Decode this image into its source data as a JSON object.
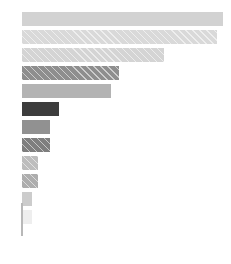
{
  "chart_data": {
    "type": "bar",
    "orientation": "horizontal",
    "title": "",
    "subtitle": "",
    "xlabel": "",
    "ylabel": "",
    "grid": false,
    "legend": null,
    "legend_position": "none",
    "categories": [
      "1",
      "2",
      "3",
      "4",
      "5",
      "6",
      "7",
      "8",
      "9",
      "10",
      "11",
      "12"
    ],
    "tick_labels": [],
    "xlim": [
      0,
      100
    ],
    "ylim": [
      0,
      12
    ],
    "values": [
      100,
      97,
      71,
      49,
      45,
      19,
      15,
      15,
      9,
      9,
      6,
      6
    ],
    "series": [
      {
        "name": "",
        "values": [
          100,
          97,
          71,
          49,
          45,
          19,
          15,
          15,
          9,
          9,
          6,
          6
        ]
      }
    ],
    "bars": [
      {
        "index": 1,
        "value": 100,
        "color": "#d2d2d2",
        "hatched": false
      },
      {
        "index": 2,
        "value": 97,
        "color": "#d9d9d9",
        "hatched": true
      },
      {
        "index": 3,
        "value": 71,
        "color": "#d4d4d4",
        "hatched": true
      },
      {
        "index": 4,
        "value": 49,
        "color": "#8e8e8e",
        "hatched": true
      },
      {
        "index": 5,
        "value": 45,
        "color": "#b3b3b3",
        "hatched": false
      },
      {
        "index": 6,
        "value": 19,
        "color": "#3d3d3d",
        "hatched": false
      },
      {
        "index": 7,
        "value": 15,
        "color": "#919191",
        "hatched": false
      },
      {
        "index": 8,
        "value": 15,
        "color": "#7e7e7e",
        "hatched": true
      },
      {
        "index": 9,
        "value": 9,
        "color": "#bdbdbd",
        "hatched": true
      },
      {
        "index": 10,
        "value": 9,
        "color": "#adadad",
        "hatched": true
      },
      {
        "index": 11,
        "value": 6,
        "color": "#cccccc",
        "hatched": false
      },
      {
        "index": 12,
        "value": 6,
        "color": "#eeeeee",
        "hatched": false
      }
    ],
    "axis": {
      "spine_color": "#b8b8b8",
      "spine_visible": true,
      "ticks_visible": false
    }
  }
}
